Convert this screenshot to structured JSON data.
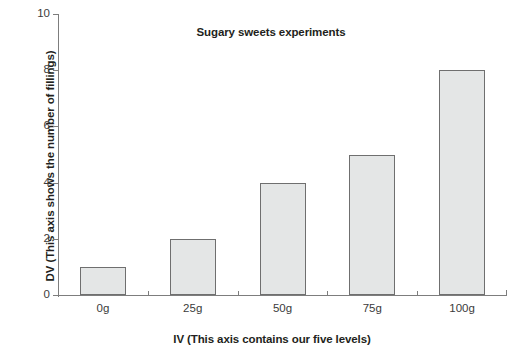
{
  "chart_data": {
    "type": "bar",
    "title": "Sugary sweets experiments",
    "xlabel": "IV (This axis contains our five levels)",
    "ylabel": "DV (This axis shows the number of fillings)",
    "categories": [
      "0g",
      "25g",
      "50g",
      "75g",
      "100g"
    ],
    "values": [
      1,
      2,
      4,
      5,
      8
    ],
    "ylim": [
      0,
      10
    ],
    "yticks": [
      0,
      2,
      4,
      6,
      8,
      10
    ],
    "ytick_labels": [
      "0",
      "2",
      "4",
      "6",
      "8",
      "10"
    ],
    "grid": false,
    "legend": false,
    "bar_fill_color": "#e4e6e6",
    "bar_border_color": "#6f6f6f",
    "axis_color": "#7d7d7d",
    "text_color": "#231f20",
    "background_color": "#ffffff"
  }
}
